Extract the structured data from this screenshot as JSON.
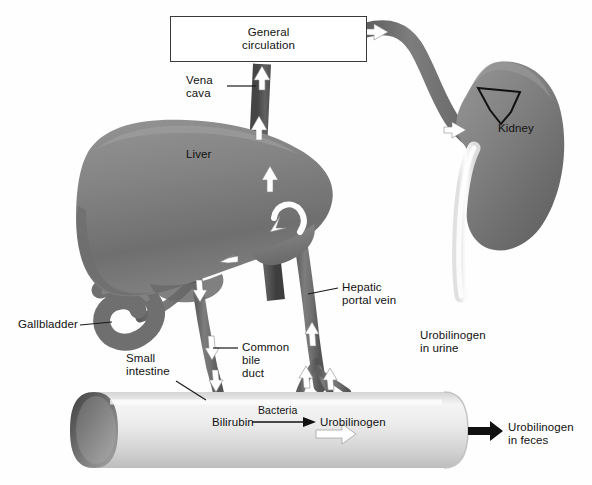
{
  "figure": {
    "background_color": "#fefefe"
  },
  "boxes": {
    "general_circulation": {
      "label": "General\ncirculation",
      "border_color": "#3a3a3a",
      "fill_color": "#ffffff"
    }
  },
  "labels": {
    "vena_cava": "Vena\ncava",
    "liver": "Liver",
    "kidney": "Kidney",
    "gallbladder": "Gallbladder",
    "small_intestine": "Small\nintestine",
    "common_bile_duct": "Common\nbile\nduct",
    "hepatic_portal_vein": "Hepatic\nportal vein",
    "urobilinogen_in_urine": "Urobilinogen\nin urine",
    "urobilinogen_in_feces": "Urobilinogen\nin feces"
  },
  "reaction": {
    "substrate": "Bilirubin",
    "catalyst": "Bacteria",
    "product": "Urobilinogen"
  },
  "colors": {
    "organ_gray": "#7f7f7f",
    "organ_gray_dark": "#6b6b6b",
    "vessel_gray": "#6e6e6e",
    "vessel_dark": "#4e4e4e",
    "intestine_light": "#e9e9e9",
    "intestine_shade": "#c9c9c9",
    "intestine_lumen": "#6d6d6d",
    "ureter_white": "#fafafa",
    "arrow_white": "#ffffff",
    "text_black": "#111111"
  },
  "flow_arrows": {
    "count": 14,
    "color": "#ffffff",
    "description": "white directional arrows along vessels"
  }
}
